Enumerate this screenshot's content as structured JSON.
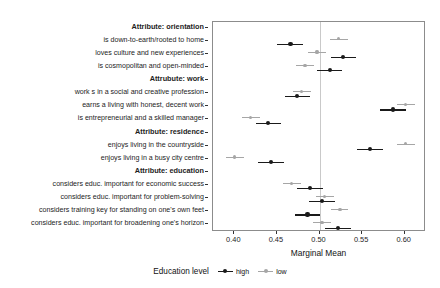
{
  "chart_data": {
    "type": "scatter",
    "title": "",
    "xlabel": "Marginal Mean",
    "ylabel": "",
    "xlim": [
      0.375,
      0.625
    ],
    "xticks": [
      0.4,
      0.45,
      0.5,
      0.55,
      0.6
    ],
    "xticklabels": [
      "0.40",
      "0.45",
      "0.50",
      "0.55",
      "0.60"
    ],
    "reference_line": 0.5,
    "grid": false,
    "legend_position": "bottom",
    "legend_title": "Education level",
    "series": [
      {
        "name": "high",
        "color": "#1a1a1a"
      },
      {
        "name": "low",
        "color": "#a6a6a6"
      }
    ],
    "categories": [
      {
        "label": "Attribute: orientation",
        "type": "group"
      },
      {
        "label": "is down-to-earth/rooted to home",
        "type": "level"
      },
      {
        "label": "loves culture and new experiences",
        "type": "level"
      },
      {
        "label": "is cosmopolitan and open-minded",
        "type": "level"
      },
      {
        "label": "Attrubute: work",
        "type": "group"
      },
      {
        "label": "work s in a social and creative profession",
        "type": "level"
      },
      {
        "label": "earns a living with honest, decent work",
        "type": "level"
      },
      {
        "label": "is entrepreneurial and a skilled manager",
        "type": "level"
      },
      {
        "label": "Attribute: residence",
        "type": "group"
      },
      {
        "label": "enjoys living in the countryside",
        "type": "level"
      },
      {
        "label": "enjoys living in a busy city centre",
        "type": "level"
      },
      {
        "label": "Attribute: education",
        "type": "group"
      },
      {
        "label": "considers educ. important for economic success",
        "type": "level"
      },
      {
        "label": "considers educ. important for problem-solving",
        "type": "level"
      },
      {
        "label": "considers training key for standing on one's own feet",
        "type": "level"
      },
      {
        "label": "considers educ. important for broadening one's horizon",
        "type": "level"
      }
    ],
    "points": [
      {
        "row": 1,
        "group": "low",
        "estimate": 0.522,
        "ci_low": 0.512,
        "ci_high": 0.533
      },
      {
        "row": 1,
        "group": "high",
        "estimate": 0.466,
        "ci_low": 0.45,
        "ci_high": 0.481
      },
      {
        "row": 2,
        "group": "low",
        "estimate": 0.497,
        "ci_low": 0.487,
        "ci_high": 0.508
      },
      {
        "row": 2,
        "group": "high",
        "estimate": 0.528,
        "ci_low": 0.513,
        "ci_high": 0.543
      },
      {
        "row": 3,
        "group": "low",
        "estimate": 0.483,
        "ci_low": 0.472,
        "ci_high": 0.493
      },
      {
        "row": 3,
        "group": "high",
        "estimate": 0.512,
        "ci_low": 0.497,
        "ci_high": 0.527
      },
      {
        "row": 5,
        "group": "low",
        "estimate": 0.479,
        "ci_low": 0.469,
        "ci_high": 0.49
      },
      {
        "row": 5,
        "group": "high",
        "estimate": 0.474,
        "ci_low": 0.459,
        "ci_high": 0.489
      },
      {
        "row": 6,
        "group": "low",
        "estimate": 0.601,
        "ci_low": 0.591,
        "ci_high": 0.612
      },
      {
        "row": 6,
        "group": "high",
        "estimate": 0.586,
        "ci_low": 0.571,
        "ci_high": 0.601
      },
      {
        "row": 7,
        "group": "low",
        "estimate": 0.419,
        "ci_low": 0.409,
        "ci_high": 0.43
      },
      {
        "row": 7,
        "group": "high",
        "estimate": 0.44,
        "ci_low": 0.425,
        "ci_high": 0.455
      },
      {
        "row": 9,
        "group": "low",
        "estimate": 0.601,
        "ci_low": 0.591,
        "ci_high": 0.612
      },
      {
        "row": 9,
        "group": "high",
        "estimate": 0.559,
        "ci_low": 0.544,
        "ci_high": 0.574
      },
      {
        "row": 10,
        "group": "low",
        "estimate": 0.4,
        "ci_low": 0.39,
        "ci_high": 0.411
      },
      {
        "row": 10,
        "group": "high",
        "estimate": 0.443,
        "ci_low": 0.428,
        "ci_high": 0.458
      },
      {
        "row": 12,
        "group": "low",
        "estimate": 0.467,
        "ci_low": 0.457,
        "ci_high": 0.478
      },
      {
        "row": 12,
        "group": "high",
        "estimate": 0.489,
        "ci_low": 0.474,
        "ci_high": 0.504
      },
      {
        "row": 13,
        "group": "low",
        "estimate": 0.506,
        "ci_low": 0.496,
        "ci_high": 0.517
      },
      {
        "row": 13,
        "group": "high",
        "estimate": 0.503,
        "ci_low": 0.488,
        "ci_high": 0.518
      },
      {
        "row": 14,
        "group": "low",
        "estimate": 0.524,
        "ci_low": 0.513,
        "ci_high": 0.534
      },
      {
        "row": 14,
        "group": "high",
        "estimate": 0.486,
        "ci_low": 0.471,
        "ci_high": 0.501
      },
      {
        "row": 15,
        "group": "low",
        "estimate": 0.503,
        "ci_low": 0.492,
        "ci_high": 0.513
      },
      {
        "row": 15,
        "group": "high",
        "estimate": 0.522,
        "ci_low": 0.507,
        "ci_high": 0.537
      }
    ]
  },
  "legend": {
    "title": "Education level",
    "high_label": "high",
    "low_label": "low"
  },
  "axis": {
    "x_title": "Marginal Mean"
  }
}
